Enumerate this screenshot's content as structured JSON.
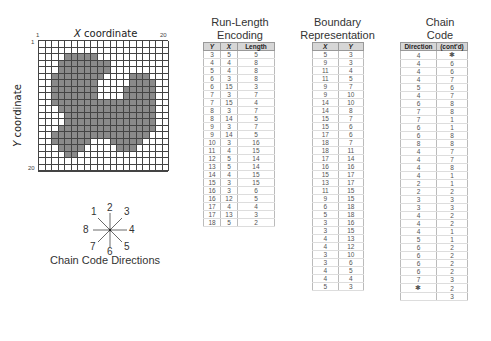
{
  "grid": {
    "x_axis_label_prefix": "X",
    "x_axis_label": " coordinate",
    "y_axis_label_prefix": "Y",
    "y_axis_label": " coordinate",
    "x_start": "1",
    "x_end": "20",
    "y_start": "1",
    "y_end": "20",
    "size": 20,
    "fill_color": "#8a8a8a"
  },
  "compass": {
    "directions": [
      "1",
      "2",
      "3",
      "4",
      "5",
      "6",
      "7",
      "8"
    ],
    "caption": "Chain Code Directions"
  },
  "run_length": {
    "title_line1": "Run-Length",
    "title_line2": "Encoding",
    "headers": [
      "Y",
      "X",
      "Length"
    ],
    "rows": [
      [
        "3",
        "5",
        "5"
      ],
      [
        "4",
        "4",
        "8"
      ],
      [
        "5",
        "4",
        "8"
      ],
      [
        "6",
        "3",
        "8"
      ],
      [
        "6",
        "15",
        "3"
      ],
      [
        "7",
        "3",
        "7"
      ],
      [
        "7",
        "15",
        "4"
      ],
      [
        "8",
        "3",
        "7"
      ],
      [
        "8",
        "14",
        "5"
      ],
      [
        "9",
        "3",
        "7"
      ],
      [
        "9",
        "14",
        "5"
      ],
      [
        "10",
        "3",
        "16"
      ],
      [
        "11",
        "4",
        "15"
      ],
      [
        "12",
        "5",
        "14"
      ],
      [
        "13",
        "5",
        "14"
      ],
      [
        "14",
        "4",
        "15"
      ],
      [
        "15",
        "3",
        "15"
      ],
      [
        "16",
        "3",
        "6"
      ],
      [
        "16",
        "12",
        "5"
      ],
      [
        "17",
        "4",
        "4"
      ],
      [
        "17",
        "13",
        "3"
      ],
      [
        "18",
        "5",
        "2"
      ]
    ]
  },
  "boundary": {
    "title_line1": "Boundary",
    "title_line2": "Representation",
    "headers": [
      "X",
      "Y"
    ],
    "rows": [
      [
        "5",
        "3"
      ],
      [
        "9",
        "3"
      ],
      [
        "11",
        "4"
      ],
      [
        "11",
        "5"
      ],
      [
        "9",
        "7"
      ],
      [
        "9",
        "10"
      ],
      [
        "14",
        "10"
      ],
      [
        "14",
        "8"
      ],
      [
        "15",
        "7"
      ],
      [
        "15",
        "6"
      ],
      [
        "17",
        "6"
      ],
      [
        "18",
        "7"
      ],
      [
        "18",
        "11"
      ],
      [
        "17",
        "14"
      ],
      [
        "16",
        "16"
      ],
      [
        "15",
        "17"
      ],
      [
        "13",
        "17"
      ],
      [
        "11",
        "15"
      ],
      [
        "9",
        "15"
      ],
      [
        "6",
        "18"
      ],
      [
        "5",
        "18"
      ],
      [
        "3",
        "16"
      ],
      [
        "3",
        "15"
      ],
      [
        "4",
        "13"
      ],
      [
        "4",
        "12"
      ],
      [
        "3",
        "10"
      ],
      [
        "3",
        "6"
      ],
      [
        "4",
        "5"
      ],
      [
        "4",
        "4"
      ],
      [
        "5",
        "3"
      ]
    ]
  },
  "chain_code": {
    "title_line1": "Chain",
    "title_line2": "Code",
    "headers": [
      "Direction",
      "(cont'd)"
    ],
    "rows": [
      [
        "4",
        "✱"
      ],
      [
        "4",
        "6"
      ],
      [
        "4",
        "6"
      ],
      [
        "4",
        "7"
      ],
      [
        "5",
        "6"
      ],
      [
        "4",
        "7"
      ],
      [
        "6",
        "8"
      ],
      [
        "7",
        "8"
      ],
      [
        "7",
        "1"
      ],
      [
        "6",
        "1"
      ],
      [
        "6",
        "8"
      ],
      [
        "8",
        "8"
      ],
      [
        "4",
        "7"
      ],
      [
        "4",
        "7"
      ],
      [
        "4",
        "8"
      ],
      [
        "4",
        "1"
      ],
      [
        "2",
        "1"
      ],
      [
        "2",
        "2"
      ],
      [
        "3",
        "3"
      ],
      [
        "3",
        "3"
      ],
      [
        "4",
        "2"
      ],
      [
        "4",
        "2"
      ],
      [
        "4",
        "1"
      ],
      [
        "5",
        "1"
      ],
      [
        "6",
        "2"
      ],
      [
        "6",
        "2"
      ],
      [
        "6",
        "2"
      ],
      [
        "6",
        "2"
      ],
      [
        "7",
        "3"
      ],
      [
        "✱",
        "2"
      ],
      [
        "",
        "3"
      ]
    ]
  }
}
